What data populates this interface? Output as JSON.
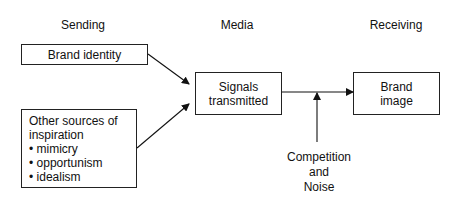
{
  "headers": {
    "sending": "Sending",
    "media": "Media",
    "receiving": "Receiving"
  },
  "nodes": {
    "brand_identity": "Brand identity",
    "other_sources": {
      "title_line1": "Other sources of",
      "title_line2": "inspiration",
      "items": [
        "• mimicry",
        "• opportunism",
        "• idealism"
      ]
    },
    "signals_line1": "Signals",
    "signals_line2": "transmitted",
    "brand_image_line1": "Brand",
    "brand_image_line2": "image"
  },
  "noise_label": {
    "line1": "Competition",
    "line2": "and",
    "line3": "Noise"
  },
  "edges": [
    {
      "from": "Brand identity",
      "to": "Signals transmitted"
    },
    {
      "from": "Other sources of inspiration",
      "to": "Signals transmitted"
    },
    {
      "from": "Signals transmitted",
      "to": "Brand image"
    },
    {
      "from": "Competition and Noise",
      "to": "Signals transmitted -> Brand image link"
    }
  ]
}
